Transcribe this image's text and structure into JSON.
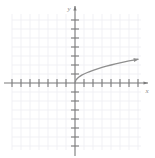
{
  "figure": {
    "title": "",
    "background_color": "#ffffff"
  },
  "chart_data": {
    "type": "line",
    "title": "",
    "xlabel": "x",
    "ylabel": "y",
    "grid": true,
    "legend": null,
    "xlim": [
      -7,
      8
    ],
    "ylim": [
      -7,
      7
    ],
    "x_ticks": [
      -7,
      -6,
      -5,
      -4,
      -3,
      -2,
      -1,
      1,
      2,
      3,
      4,
      5,
      6,
      7
    ],
    "y_ticks": [
      -7,
      -6,
      -5,
      -4,
      -3,
      -2,
      -1,
      1,
      2,
      3,
      4,
      5,
      6
    ],
    "x_tick_labels": [],
    "y_tick_labels": [],
    "annotations": [
      {
        "name": "curve-arrowhead",
        "x": 7.1,
        "y": 2.65
      }
    ],
    "series": [
      {
        "name": "square-root-curve",
        "equation": "y = sqrt(x)",
        "color": "#8f8f8f",
        "x": [
          0,
          0.1,
          0.25,
          0.5,
          0.75,
          1,
          1.5,
          2,
          2.5,
          3,
          3.5,
          4,
          4.5,
          5,
          5.5,
          6,
          6.5,
          7
        ],
        "y": [
          0,
          0.32,
          0.5,
          0.71,
          0.87,
          1,
          1.22,
          1.41,
          1.58,
          1.73,
          1.87,
          2,
          2.12,
          2.24,
          2.35,
          2.45,
          2.55,
          2.65
        ]
      }
    ]
  },
  "axes": {
    "x_axis_label": "x",
    "y_axis_label": "y",
    "axis_color": "#7a7a7a",
    "grid_color": "#ededf2",
    "curve_color": "#8f8f8f"
  }
}
